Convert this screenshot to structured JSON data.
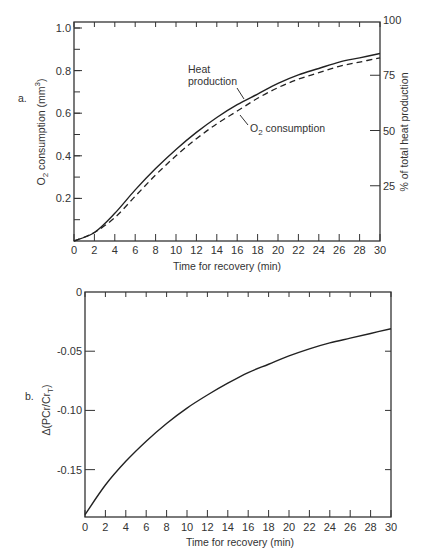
{
  "chart_data": [
    {
      "panel": "a.",
      "type": "line",
      "title": "",
      "xlabel": "Time for recovery (min)",
      "ylabel": "O2 consumption (mm3)",
      "ylabel_right": "% of total heat production",
      "xlim": [
        0,
        30
      ],
      "ylim": [
        0,
        1.0
      ],
      "ylim_right": [
        0,
        100
      ],
      "x_ticks": [
        0,
        2,
        4,
        6,
        8,
        10,
        12,
        14,
        16,
        18,
        20,
        22,
        24,
        26,
        28,
        30
      ],
      "y_ticks": [
        0.2,
        0.4,
        0.6,
        0.8,
        1.0
      ],
      "y_tick_labels": [
        "0.2",
        "0.4",
        "0.6",
        "0.8",
        "1.0"
      ],
      "y_right_ticks": [
        25,
        50,
        75,
        100
      ],
      "grid": false,
      "x": [
        0,
        2,
        4,
        6,
        8,
        10,
        12,
        14,
        16,
        18,
        20,
        22,
        24,
        26,
        28,
        30
      ],
      "series": [
        {
          "name": "Heat production",
          "style": "solid",
          "values": [
            0,
            0.04,
            0.13,
            0.24,
            0.34,
            0.43,
            0.51,
            0.58,
            0.64,
            0.69,
            0.74,
            0.78,
            0.81,
            0.84,
            0.86,
            0.88
          ]
        },
        {
          "name": "O2 consumption",
          "style": "dashed",
          "values": [
            0,
            0.04,
            0.11,
            0.21,
            0.31,
            0.4,
            0.48,
            0.55,
            0.61,
            0.67,
            0.72,
            0.76,
            0.79,
            0.82,
            0.84,
            0.86
          ]
        }
      ],
      "annotations": [
        "Heat production",
        "O2 consumption"
      ]
    },
    {
      "panel": "b.",
      "type": "line",
      "title": "",
      "xlabel": "Time for recovery (min)",
      "ylabel": "Δ(PCr/CrT)",
      "xlim": [
        0,
        30
      ],
      "ylim": [
        -0.19,
        0
      ],
      "x_ticks": [
        0,
        2,
        4,
        6,
        8,
        10,
        12,
        14,
        16,
        18,
        20,
        22,
        24,
        26,
        28,
        30
      ],
      "y_ticks": [
        0,
        -0.05,
        -0.1,
        -0.15
      ],
      "y_tick_labels": [
        "0",
        "-0.05",
        "-0.10",
        "-0.15"
      ],
      "grid": false,
      "x": [
        0,
        2,
        4,
        6,
        8,
        10,
        12,
        14,
        16,
        18,
        20,
        22,
        24,
        26,
        28,
        30
      ],
      "series": [
        {
          "name": "Δ(PCr/CrT)",
          "style": "solid",
          "values": [
            -0.188,
            -0.163,
            -0.143,
            -0.126,
            -0.111,
            -0.098,
            -0.087,
            -0.077,
            -0.068,
            -0.061,
            -0.054,
            -0.048,
            -0.043,
            -0.039,
            -0.035,
            -0.031
          ]
        }
      ]
    }
  ],
  "labels": {
    "panel_a": "a.",
    "panel_b": "b.",
    "a_xlabel": "Time for recovery (min)",
    "a_ylabel_left_main": "O",
    "a_ylabel_left_sub": "2",
    "a_ylabel_left_rest": " consumption (mm",
    "a_ylabel_left_sup": "3",
    "a_ylabel_left_end": ")",
    "a_ylabel_right": "% of total heat production",
    "a_annot_heat_1": "Heat",
    "a_annot_heat_2": "production",
    "a_annot_o2_main": "O",
    "a_annot_o2_sub": "2",
    "a_annot_o2_rest": " consumption",
    "b_xlabel": "Time for recovery (min)",
    "b_ylabel_main": "Δ(PCr/Cr",
    "b_ylabel_sub": "T",
    "b_ylabel_end": ")"
  },
  "colors": {
    "line": "#222222",
    "axis": "#333333",
    "background": "#ffffff"
  }
}
